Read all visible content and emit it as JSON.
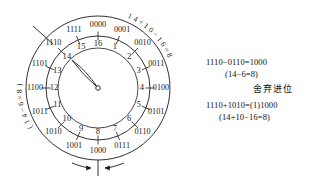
{
  "figure": {
    "type": "binary-mod16-clock-diagram",
    "center": {
      "x": 98,
      "y": 88
    },
    "outer_radius": 72,
    "middle_radius": 52,
    "inner_tick_radius": 40,
    "hand_target_label": "14",
    "hand_angle_deg": -133,
    "stroke_color": "#1a1a1a",
    "outer_ring": {
      "label": "4-bit binary ring",
      "values": [
        "0000",
        "0001",
        "0010",
        "0011",
        "0100",
        "0101",
        "0110",
        "0111",
        "1000",
        "1001",
        "1010",
        "1011",
        "1100",
        "1101",
        "1110",
        "1111"
      ],
      "start_angle_deg": -90,
      "step_deg": 22.5,
      "label_radius": 63
    },
    "inner_ring": {
      "label": "decimal ring",
      "values": [
        "16",
        "1",
        "2",
        "3",
        "4",
        "5",
        "6",
        "7",
        "8",
        "9",
        "10",
        "11",
        "12",
        "13",
        "14",
        "15"
      ],
      "start_angle_deg": -90,
      "step_deg": 22.5,
      "label_radius": 44
    },
    "curved_labels": [
      {
        "name": "carry-annotation",
        "text": "14+10−16=8",
        "start_angle_deg": -66,
        "radius": 78,
        "direction": "cw"
      },
      {
        "name": "subtract-annotation",
        "text": "(14−6=8)",
        "start_angle_deg": 150,
        "radius": 78,
        "direction": "cw"
      }
    ],
    "bottom_marker": {
      "name": "wrap-arrows",
      "tick_x": 98,
      "tick_top": 160,
      "tick_bottom": 176,
      "left_arrow_from_x": 72,
      "right_arrow_from_x": 124,
      "arrow_y": 168
    },
    "boundary_slash": {
      "x1": 33,
      "y1": 26,
      "x2": 53,
      "y2": 44
    }
  },
  "equations": {
    "line1": "1110−0110=1000",
    "line2": "(14−6=8)",
    "line3": "舍弃进位",
    "line4": "1110+1010=(1)1000",
    "line5": "(14+10−16=8)"
  }
}
